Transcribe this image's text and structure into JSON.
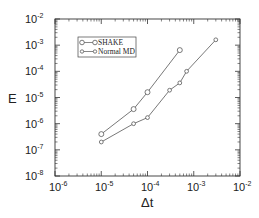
{
  "chart_data": {
    "type": "line",
    "title": "",
    "xlabel": "Δt",
    "ylabel": "E",
    "xscale": "log",
    "yscale": "log",
    "xlim": [
      1e-06,
      0.01
    ],
    "ylim": [
      1e-08,
      0.01
    ],
    "x_ticks": [
      "10^-6",
      "10^-5",
      "10^-4",
      "10^-3",
      "10^-2"
    ],
    "y_ticks": [
      "10^-8",
      "10^-7",
      "10^-6",
      "10^-5",
      "10^-4",
      "10^-3",
      "10^-2"
    ],
    "grid": false,
    "legend_position": "upper left",
    "series": [
      {
        "name": "SHAKE",
        "marker": "circle-large",
        "x": [
          1e-05,
          5e-05,
          0.0001,
          0.0005
        ],
        "y": [
          4e-07,
          3.6e-06,
          1.6e-05,
          0.00065
        ]
      },
      {
        "name": "Normal MD",
        "marker": "circle-small",
        "x": [
          1e-05,
          5e-05,
          0.0001,
          0.0003,
          0.0005,
          0.0007,
          0.003
        ],
        "y": [
          2e-07,
          1e-06,
          1.7e-06,
          1.9e-05,
          3.6e-05,
          0.0001,
          0.0016
        ]
      }
    ]
  },
  "axes": {
    "x_tick_bases": [
      "10",
      "10",
      "10",
      "10",
      "10"
    ],
    "x_tick_exps": [
      "-6",
      "-5",
      "-4",
      "-3",
      "-2"
    ],
    "y_tick_bases": [
      "10",
      "10",
      "10",
      "10",
      "10",
      "10",
      "10"
    ],
    "y_tick_exps": [
      "-8",
      "-7",
      "-6",
      "-5",
      "-4",
      "-3",
      "-2"
    ],
    "xlabel": "Δt",
    "ylabel": "E"
  },
  "legend": {
    "items": [
      {
        "label": "SHAKE"
      },
      {
        "label": "Normal MD"
      }
    ]
  },
  "colors": {
    "line": "#555555",
    "frame": "#333333",
    "text": "#222222"
  }
}
